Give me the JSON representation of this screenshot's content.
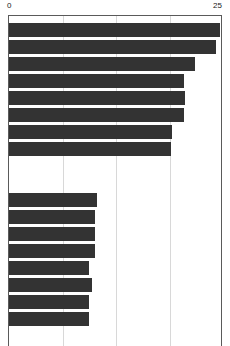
{
  "chart_data": {
    "type": "bar",
    "orientation": "horizontal",
    "title": "",
    "subtitle": "",
    "xlabel": "",
    "ylabel": "",
    "xlim": [
      0,
      25
    ],
    "ylim": null,
    "grid": true,
    "grid_axis": "x",
    "legend": null,
    "legend_position": "none",
    "axis_tick_labels_visible": [
      "0",
      "25"
    ],
    "xticks": [
      0,
      6.25,
      12.5,
      18.75,
      25
    ],
    "xtick_labels": [
      "0",
      "",
      "",
      "",
      "25"
    ],
    "yticks_visible": false,
    "categories": [
      "",
      "",
      "",
      "",
      "",
      "",
      "",
      "",
      "",
      "",
      "",
      "",
      "",
      "",
      "",
      ""
    ],
    "values": [
      24.6,
      24.2,
      21.7,
      20.4,
      20.6,
      20.4,
      19.0,
      18.9,
      10.3,
      10.0,
      10.0,
      10.0,
      9.4,
      9.7,
      9.4,
      9.4
    ],
    "groups": [
      {
        "name": "upper-group",
        "bar_count": 8,
        "values": [
          24.6,
          24.2,
          21.7,
          20.4,
          20.6,
          20.4,
          19.0,
          18.9
        ]
      },
      {
        "name": "lower-group",
        "bar_count": 8,
        "values": [
          10.3,
          10.0,
          10.0,
          10.0,
          9.4,
          9.7,
          9.4,
          9.4
        ]
      }
    ],
    "bar_color": "#333333",
    "background_color": "#ffffff",
    "gridline_color": "#d8d8d8",
    "axis_color": "#5a5a5a"
  },
  "axis": {
    "min_label": "0",
    "max_label": "25"
  },
  "bars": [
    {
      "index": 0,
      "value": 24.6,
      "group": "upper-group",
      "top": 7,
      "height": 14
    },
    {
      "index": 1,
      "value": 24.2,
      "group": "upper-group",
      "top": 24,
      "height": 14
    },
    {
      "index": 2,
      "value": 21.7,
      "group": "upper-group",
      "top": 41,
      "height": 14
    },
    {
      "index": 3,
      "value": 20.4,
      "group": "upper-group",
      "top": 58,
      "height": 14
    },
    {
      "index": 4,
      "value": 20.6,
      "group": "upper-group",
      "top": 75,
      "height": 14
    },
    {
      "index": 5,
      "value": 20.4,
      "group": "upper-group",
      "top": 92,
      "height": 14
    },
    {
      "index": 6,
      "value": 19.0,
      "group": "upper-group",
      "top": 109,
      "height": 14
    },
    {
      "index": 7,
      "value": 18.9,
      "group": "upper-group",
      "top": 126,
      "height": 14
    },
    {
      "index": 8,
      "value": 10.3,
      "group": "lower-group",
      "top": 177,
      "height": 14
    },
    {
      "index": 9,
      "value": 10.0,
      "group": "lower-group",
      "top": 194,
      "height": 14
    },
    {
      "index": 10,
      "value": 10.0,
      "group": "lower-group",
      "top": 211,
      "height": 14
    },
    {
      "index": 11,
      "value": 10.0,
      "group": "lower-group",
      "top": 228,
      "height": 14
    },
    {
      "index": 12,
      "value": 9.4,
      "group": "lower-group",
      "top": 245,
      "height": 14
    },
    {
      "index": 13,
      "value": 9.7,
      "group": "lower-group",
      "top": 262,
      "height": 14
    },
    {
      "index": 14,
      "value": 9.4,
      "group": "lower-group",
      "top": 279,
      "height": 14
    },
    {
      "index": 15,
      "value": 9.4,
      "group": "lower-group",
      "top": 296,
      "height": 14
    }
  ],
  "gridlines": [
    {
      "value": 0
    },
    {
      "value": 6.25
    },
    {
      "value": 12.5
    },
    {
      "value": 18.75
    },
    {
      "value": 25
    }
  ]
}
